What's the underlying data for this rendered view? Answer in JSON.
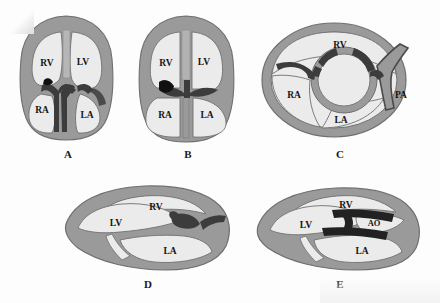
{
  "figure": {
    "background_color": "#fdfdfd",
    "colors": {
      "myocardium_wall": "#9a9a9a",
      "wall_outline": "#6f6f6f",
      "chamber_lumen": "#ebebeb",
      "valve_dark": "#3c3c3c",
      "valve_black": "#111111",
      "label_text": "#151515"
    },
    "panels": [
      {
        "id": "A",
        "letter": "A",
        "view": "four-chamber-view-with-atrioventricular-valves",
        "chambers": [
          {
            "code": "RV",
            "name": "right ventricle"
          },
          {
            "code": "LV",
            "name": "left ventricle"
          },
          {
            "code": "RA",
            "name": "right atrium"
          },
          {
            "code": "LA",
            "name": "left atrium"
          }
        ]
      },
      {
        "id": "B",
        "letter": "B",
        "view": "four-chamber-view-with-common-valve-plane",
        "chambers": [
          {
            "code": "RV",
            "name": "right ventricle"
          },
          {
            "code": "LV",
            "name": "left ventricle"
          },
          {
            "code": "RA",
            "name": "right atrium"
          },
          {
            "code": "LA",
            "name": "left atrium"
          }
        ]
      },
      {
        "id": "C",
        "letter": "C",
        "view": "short-axis-basal-cross-section",
        "chambers": [
          {
            "code": "RV",
            "name": "right ventricle"
          },
          {
            "code": "RA",
            "name": "right atrium"
          },
          {
            "code": "LA",
            "name": "left atrium"
          },
          {
            "code": "PA",
            "name": "pulmonary artery"
          }
        ]
      },
      {
        "id": "D",
        "letter": "D",
        "view": "long-axis-view-mitral-valve",
        "chambers": [
          {
            "code": "RV",
            "name": "right ventricle"
          },
          {
            "code": "LV",
            "name": "left ventricle"
          },
          {
            "code": "LA",
            "name": "left atrium"
          }
        ]
      },
      {
        "id": "E",
        "letter": "E",
        "view": "long-axis-view-aortic-outflow",
        "chambers": [
          {
            "code": "RV",
            "name": "right ventricle"
          },
          {
            "code": "LV",
            "name": "left ventricle"
          },
          {
            "code": "LA",
            "name": "left atrium"
          },
          {
            "code": "AO",
            "name": "aorta"
          }
        ]
      }
    ]
  }
}
